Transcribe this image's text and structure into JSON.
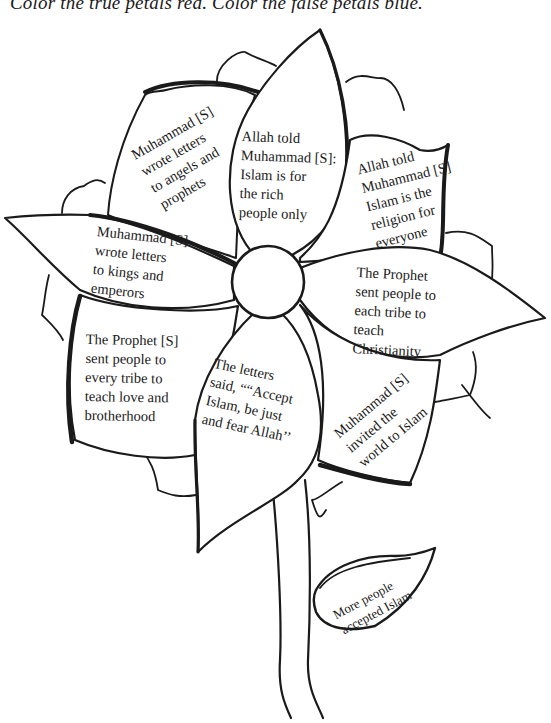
{
  "instructions": "Color the true petals red. Color the false petals blue.",
  "colors": {
    "ink": "#1a1a1a",
    "paper": "#ffffff"
  },
  "petals": [
    {
      "id": "angels",
      "text": "Muhammad [S]\nwrote letters\nto angels and\nprophets"
    },
    {
      "id": "rich",
      "text": "Allah told\nMuhammad [S]:\nIslam is for\nthe rich\npeople only"
    },
    {
      "id": "everyone",
      "text": "Allah told\nMuhammad [S]\nIslam is the\nreligion for\neveryone"
    },
    {
      "id": "kings",
      "text": "Muhammad [S]\nwrote letters\nto kings and\nemperors"
    },
    {
      "id": "christianity",
      "text": "The Prophet\nsent people to\neach tribe to\nteach\nChristianity"
    },
    {
      "id": "brotherhood",
      "text": "The Prophet [S]\nsent people to\nevery tribe to\nteach love and\nbrotherhood"
    },
    {
      "id": "letters-said",
      "text": "The letters\nsaid, ““Accept\nIslam, be just\nand fear Allah’’"
    },
    {
      "id": "invited",
      "text": "Muhammad [S]\ninvited the\nworld to Islam"
    }
  ],
  "leaf": {
    "text": "More people\naccepted Islam"
  }
}
